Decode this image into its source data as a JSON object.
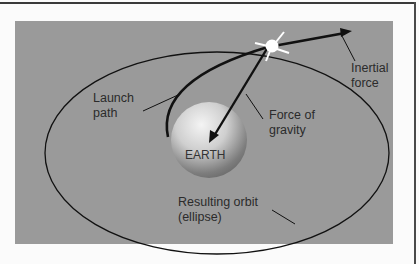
{
  "diagram": {
    "labels": {
      "launch_path": [
        "Launch",
        "path"
      ],
      "inertial_force": [
        "Inertial",
        "force"
      ],
      "force_of_gravity": [
        "Force of",
        "gravity"
      ],
      "earth": "EARTH",
      "resulting_orbit": [
        "Resulting orbit",
        "(ellipse)"
      ]
    },
    "colors": {
      "panel": "#9a9a9a",
      "page": "#fbfbfb",
      "lines": "#111111",
      "text": "#2b2b2b",
      "satellite": "#ffffff"
    },
    "icons": {
      "satellite": "starburst-icon",
      "earth": "sphere-icon"
    }
  }
}
